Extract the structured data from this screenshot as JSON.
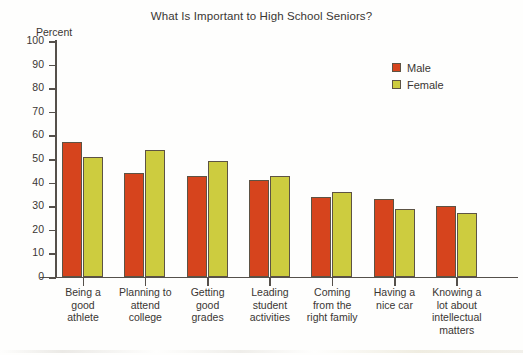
{
  "chart_data": {
    "type": "bar",
    "title": "What Is Important to High School Seniors?",
    "xlabel": "",
    "ylabel": "Percent",
    "ylim": [
      0,
      100
    ],
    "yticks": [
      100,
      90,
      80,
      70,
      60,
      50,
      40,
      30,
      20,
      10,
      0
    ],
    "grid": false,
    "legend_position": "top-right",
    "categories": [
      "Being a\ngood\nathlete",
      "Planning to\nattend\ncollege",
      "Getting\ngood\ngrades",
      "Leading\nstudent\nactivities",
      "Coming\nfrom the\nright family",
      "Having a\nnice car",
      "Knowing a\nlot about\nintellectual\nmatters"
    ],
    "series": [
      {
        "name": "Male",
        "color": "#d6441d",
        "values": [
          57,
          44,
          43,
          41,
          34,
          33,
          30
        ]
      },
      {
        "name": "Female",
        "color": "#cdcc3f",
        "values": [
          51,
          54,
          49,
          43,
          36,
          29,
          27
        ]
      }
    ]
  },
  "legend": {
    "items": [
      {
        "label": "Male",
        "color": "#d6441d"
      },
      {
        "label": "Female",
        "color": "#cdcc3f"
      }
    ]
  }
}
